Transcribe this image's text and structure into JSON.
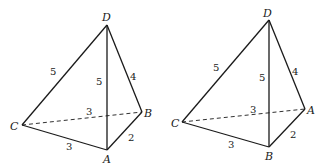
{
  "figures": [
    {
      "name": "left-tetrahedron",
      "vertices": {
        "D": "D",
        "B": "B",
        "C": "C",
        "A": "A"
      },
      "edges": {
        "CD": "5",
        "AD": "5",
        "BD": "4",
        "CB": "3",
        "CA": "3",
        "AB": "2"
      }
    },
    {
      "name": "right-tetrahedron",
      "vertices": {
        "D": "D",
        "A": "A",
        "C": "C",
        "B": "B"
      },
      "edges": {
        "CD": "5",
        "BD": "5",
        "AD": "4",
        "CA": "3",
        "CB": "3",
        "BA": "2"
      }
    }
  ]
}
